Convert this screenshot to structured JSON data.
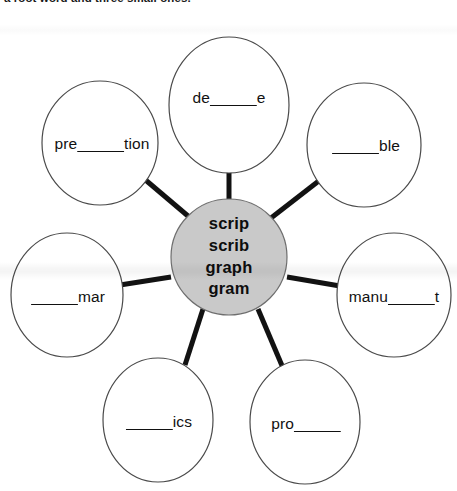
{
  "page": {
    "instruction": "a root word and three small ones.",
    "width": 457,
    "height": 491,
    "background_color": "#ffffff"
  },
  "diagram": {
    "type": "word-web",
    "line_color": "#121212",
    "node_fill": "#ffffff",
    "node_stroke": "#4a4a4a",
    "hub_fill": "#c9c9c9",
    "hub_stroke": "#6e6e6e",
    "hub": {
      "name": "root-words-hub",
      "cx": 229,
      "cy": 257,
      "r": 58,
      "words": [
        "scrip",
        "scrib",
        "graph",
        "gram"
      ]
    },
    "nodes": [
      {
        "id": "top",
        "name": "word-bubble-de-e",
        "cx": 229,
        "cy": 105,
        "rx": 60,
        "ry": 68,
        "prefix": "de",
        "blank": "   ",
        "suffix": "e",
        "label": "de______e",
        "text_cx": 229,
        "text_cy": 98
      },
      {
        "id": "top-left",
        "name": "word-bubble-pre-tion",
        "cx": 100,
        "cy": 143,
        "rx": 58,
        "ry": 62,
        "prefix": "pre",
        "blank": "   ",
        "suffix": "tion",
        "label": "pre______tion",
        "text_cx": 102,
        "text_cy": 144
      },
      {
        "id": "top-right",
        "name": "word-bubble-ble",
        "cx": 364,
        "cy": 145,
        "rx": 57,
        "ry": 62,
        "prefix": "",
        "blank": "   ",
        "suffix": "ble",
        "label": "______ble",
        "text_cx": 366,
        "text_cy": 146
      },
      {
        "id": "left",
        "name": "word-bubble-mar",
        "cx": 67,
        "cy": 295,
        "rx": 56,
        "ry": 62,
        "prefix": "",
        "blank": "   ",
        "suffix": "mar",
        "label": "______mar",
        "text_cx": 68,
        "text_cy": 297
      },
      {
        "id": "right",
        "name": "word-bubble-manu-t",
        "cx": 394,
        "cy": 295,
        "rx": 57,
        "ry": 62,
        "prefix": "manu",
        "blank": "   ",
        "suffix": "t",
        "label": "manu______t",
        "text_cx": 394,
        "text_cy": 297
      },
      {
        "id": "bottom-left",
        "name": "word-bubble-ics",
        "cx": 158,
        "cy": 420,
        "rx": 55,
        "ry": 62,
        "prefix": "",
        "blank": "   ",
        "suffix": "ics",
        "label": "______ics",
        "text_cx": 159,
        "text_cy": 422
      },
      {
        "id": "bottom-right",
        "name": "word-bubble-pro",
        "cx": 305,
        "cy": 422,
        "rx": 55,
        "ry": 62,
        "prefix": "pro",
        "blank": "   ",
        "suffix": "",
        "label": "pro______",
        "text_cx": 306,
        "text_cy": 424
      }
    ]
  }
}
